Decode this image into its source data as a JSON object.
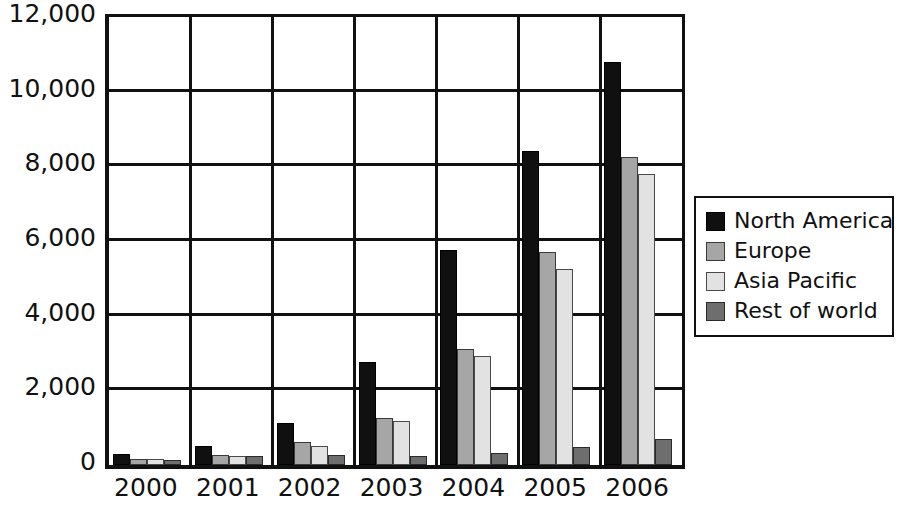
{
  "chart_data": {
    "type": "bar",
    "title": "",
    "subtitle": "",
    "xlabel": "",
    "ylabel": "",
    "categories": [
      "2000",
      "2001",
      "2002",
      "2003",
      "2004",
      "2005",
      "2006"
    ],
    "series": [
      {
        "name": "North America",
        "color": "#101010",
        "values": [
          300,
          500,
          1120,
          2750,
          5750,
          8400,
          10800
        ]
      },
      {
        "name": "Europe",
        "color": "#a6a6a6",
        "values": [
          170,
          280,
          620,
          1250,
          3100,
          5700,
          8250
        ]
      },
      {
        "name": "Asia Pacific",
        "color": "#e2e2e2",
        "values": [
          160,
          250,
          500,
          1180,
          2930,
          5250,
          7800
        ]
      },
      {
        "name": "Rest of world",
        "color": "#6e6e6e",
        "values": [
          140,
          230,
          270,
          250,
          330,
          480,
          700
        ]
      }
    ],
    "ylim": [
      0,
      12000
    ],
    "ytick_step": 2000,
    "ytick_labels": [
      "0",
      "2,000",
      "4,000",
      "6,000",
      "8,000",
      "10,000",
      "12,000"
    ],
    "ytick_values": [
      0,
      2000,
      4000,
      6000,
      8000,
      10000,
      12000
    ],
    "grid": true,
    "grid_axis": "y",
    "legend_position": "right",
    "bar_gap_group": 0.38
  },
  "legend": {
    "items": [
      {
        "label": "North America",
        "swatch": "series-0-swatch"
      },
      {
        "label": "Europe",
        "swatch": "series-1-swatch"
      },
      {
        "label": "Asia Pacific",
        "swatch": "series-2-swatch"
      },
      {
        "label": "Rest of world",
        "swatch": "series-3-swatch"
      }
    ]
  },
  "axes": {
    "y_labels": [
      "12,000",
      "10,000",
      "8,000",
      "6,000",
      "4,000",
      "2,000",
      "0"
    ],
    "x_labels": [
      "2000",
      "2001",
      "2002",
      "2003",
      "2004",
      "2005",
      "2006"
    ]
  },
  "colors": {
    "axis": "#111111",
    "background": "#ffffff",
    "series_0": "#101010",
    "series_1": "#a6a6a6",
    "series_2": "#e2e2e2",
    "series_3": "#6e6e6e"
  }
}
